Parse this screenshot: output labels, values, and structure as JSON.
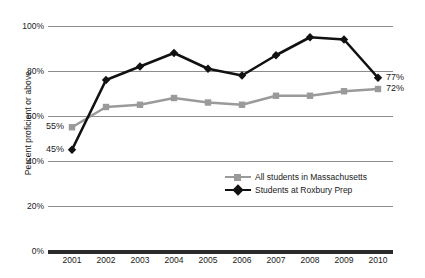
{
  "chart_data": {
    "type": "line",
    "title": "",
    "xlabel": "",
    "ylabel": "Percent proficient or above",
    "categories": [
      "2001",
      "2002",
      "2003",
      "2004",
      "2005",
      "2006",
      "2007",
      "2008",
      "2009",
      "2010"
    ],
    "ylim": [
      0,
      100
    ],
    "ytick_labels": [
      "0%",
      "20%",
      "40%",
      "60%",
      "80%",
      "100%"
    ],
    "ytick_values": [
      0,
      20,
      40,
      60,
      80,
      100
    ],
    "grid": true,
    "legend_position": "inside-center-right",
    "series": [
      {
        "name": "All students in Massachusetts",
        "color": "#9a9a9a",
        "marker": "square",
        "values": [
          55,
          64,
          65,
          68,
          66,
          65,
          69,
          69,
          71,
          72
        ]
      },
      {
        "name": "Students at Roxbury Prep",
        "color": "#111111",
        "marker": "diamond",
        "values": [
          45,
          76,
          82,
          88,
          81,
          78,
          87,
          95,
          94,
          77
        ]
      }
    ],
    "annotations": [
      {
        "text": "55%",
        "series": "All students in Massachusetts",
        "category": "2001",
        "value": 55,
        "placement": "left"
      },
      {
        "text": "45%",
        "series": "Students at Roxbury Prep",
        "category": "2001",
        "value": 45,
        "placement": "left"
      },
      {
        "text": "77%",
        "series": "Students at Roxbury Prep",
        "category": "2010",
        "value": 77,
        "placement": "right"
      },
      {
        "text": "72%",
        "series": "All students in Massachusetts",
        "category": "2010",
        "value": 72,
        "placement": "right"
      }
    ]
  }
}
